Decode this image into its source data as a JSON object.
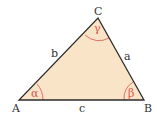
{
  "diagram": {
    "type": "triangle",
    "fill_color": "#f9e4c8",
    "edge_color": "#2b2b2b",
    "angle_color": "#d9534f",
    "vertices": {
      "A": {
        "label": "A",
        "x": 19,
        "y": 100
      },
      "B": {
        "label": "B",
        "x": 144,
        "y": 100
      },
      "C": {
        "label": "C",
        "x": 98,
        "y": 18
      }
    },
    "sides": {
      "a": {
        "label": "a"
      },
      "b": {
        "label": "b"
      },
      "c": {
        "label": "c"
      }
    },
    "angles": {
      "alpha": {
        "label": "α"
      },
      "beta": {
        "label": "β"
      },
      "gamma": {
        "label": "γ"
      }
    }
  }
}
